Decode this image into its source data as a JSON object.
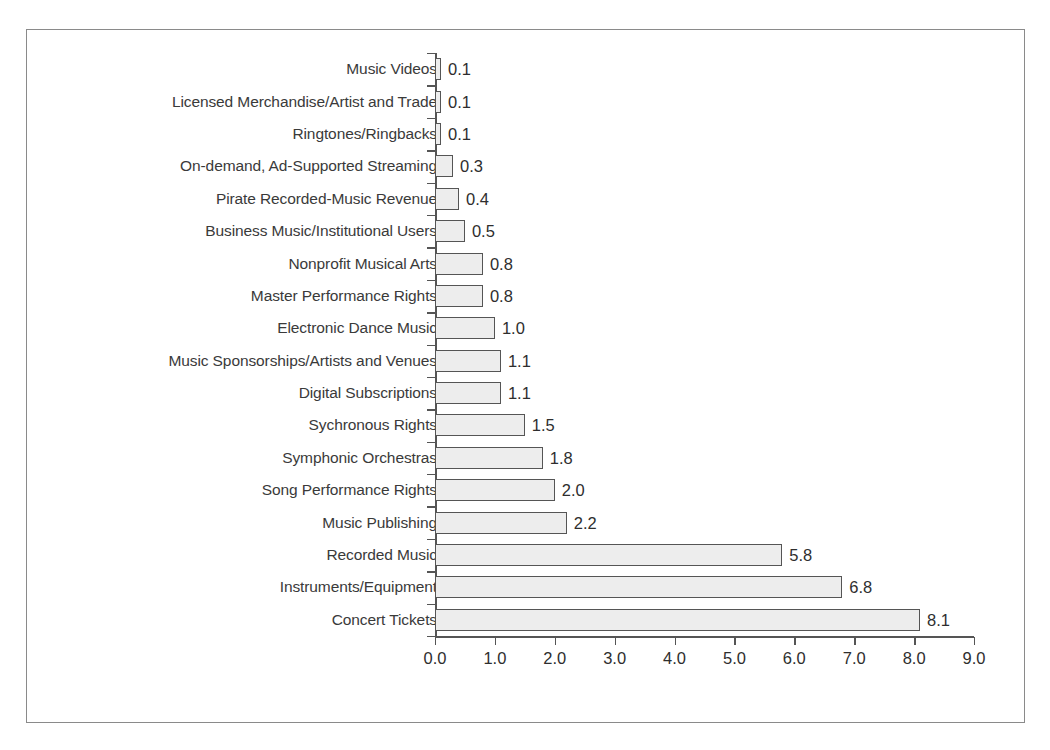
{
  "chart_data": {
    "type": "bar",
    "orientation": "horizontal",
    "title": "",
    "subtitle": "",
    "xlabel": "",
    "ylabel": "",
    "xlim": [
      0.0,
      9.0
    ],
    "xtick_step": 1.0,
    "xticks": [
      "0.0",
      "1.0",
      "2.0",
      "3.0",
      "4.0",
      "5.0",
      "6.0",
      "7.0",
      "8.0",
      "9.0"
    ],
    "grid": false,
    "legend": null,
    "value_label_format": "0.0",
    "categories": [
      "Music Videos",
      "Licensed Merchandise/Artist and Trade",
      "Ringtones/Ringbacks",
      "On-demand, Ad-Supported Streaming",
      "Pirate Recorded-Music Revenue",
      "Business Music/Institutional Users",
      "Nonprofit Musical Arts",
      "Master Performance Rights",
      "Electronic Dance Music",
      "Music Sponsorships/Artists and Venues",
      "Digital Subscriptions",
      "Sychronous Rights",
      "Symphonic Orchestras",
      "Song Performance Rights",
      "Music Publishing",
      "Recorded Music",
      "Instruments/Equipment",
      "Concert Tickets"
    ],
    "values": [
      0.1,
      0.1,
      0.1,
      0.3,
      0.4,
      0.5,
      0.8,
      0.8,
      1.0,
      1.1,
      1.1,
      1.5,
      1.8,
      2.0,
      2.2,
      5.8,
      6.8,
      8.1
    ],
    "value_labels": [
      "0.1",
      "0.1",
      "0.1",
      "0.3",
      "0.4",
      "0.5",
      "0.8",
      "0.8",
      "1.0",
      "1.1",
      "1.1",
      "1.5",
      "1.8",
      "2.0",
      "2.2",
      "5.8",
      "6.8",
      "8.1"
    ]
  },
  "style": {
    "bar_fill": "#ededed",
    "bar_border": "#555555",
    "axis_color": "#555555",
    "frame_color": "#8a8a8a",
    "label_color": "#3a3a3a",
    "value_color": "#2e2e2e",
    "background": "#ffffff"
  }
}
